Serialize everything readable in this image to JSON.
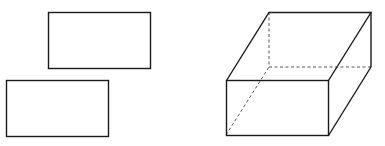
{
  "figure": {
    "width": 385,
    "height": 146,
    "background": "#ffffff",
    "stroke_color": "#1a1a1a",
    "hidden_line_color": "#555555",
    "shapes": {
      "top_rectangle": {
        "x": 48,
        "y": 12,
        "w": 102,
        "h": 56
      },
      "bottom_rectangle": {
        "x": 6,
        "y": 80,
        "w": 102,
        "h": 56
      },
      "box": {
        "front_face": {
          "x": 226,
          "y": 80,
          "w": 102,
          "h": 55
        },
        "back_top_left": [
          269,
          12
        ],
        "back_top_right": [
          371,
          12
        ],
        "back_bottom_right": [
          371,
          67
        ],
        "back_bottom_left_hidden": [
          269,
          67
        ]
      }
    }
  }
}
